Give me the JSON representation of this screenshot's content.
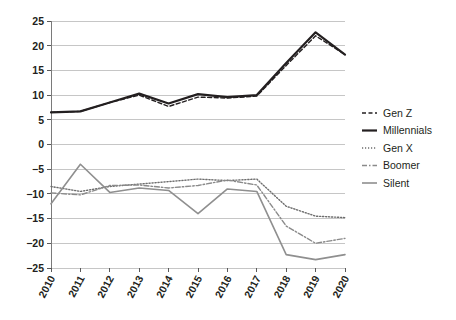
{
  "chart_data": {
    "type": "line",
    "title": "",
    "subtitle": "",
    "xlabel": "",
    "ylabel": "",
    "x": [
      2010,
      2011,
      2012,
      2013,
      2014,
      2015,
      2016,
      2017,
      2018,
      2019,
      2020
    ],
    "xtick_labels": [
      "2010",
      "2011",
      "2012",
      "2013",
      "2014",
      "2015",
      "2016",
      "2017",
      "2018",
      "2019",
      "2020"
    ],
    "ytick_labels": [
      "25",
      "20",
      "15",
      "10",
      "5",
      "0",
      "−5",
      "−10",
      "−15",
      "−20",
      "−25"
    ],
    "ytick_values": [
      25,
      20,
      15,
      10,
      5,
      0,
      -5,
      -10,
      -15,
      -20,
      -25
    ],
    "ylim": [
      -25,
      25
    ],
    "xlim": [
      2010,
      2020
    ],
    "grid": true,
    "grid_axis": "y",
    "legend_position": "right",
    "series": [
      {
        "name": "Gen Z",
        "style": "dashed",
        "color": "#231f20",
        "width": 1.4,
        "dasharray": "4,2.5",
        "values": [
          6.5,
          6.7,
          8.5,
          10.0,
          7.7,
          9.6,
          9.4,
          9.8,
          16.0,
          22.0,
          18.2
        ]
      },
      {
        "name": "Millennials",
        "style": "solid",
        "color": "#231f20",
        "width": 2.2,
        "dasharray": "none",
        "values": [
          6.5,
          6.7,
          8.5,
          10.3,
          8.3,
          10.2,
          9.6,
          10.0,
          16.5,
          22.7,
          18.2
        ]
      },
      {
        "name": "Gen X",
        "style": "dotted",
        "color": "#6d6d6d",
        "width": 1.4,
        "dasharray": "1.2,1.8",
        "values": [
          -8.5,
          -9.5,
          -8.5,
          -8.0,
          -7.5,
          -7.0,
          -7.3,
          -7.0,
          -12.5,
          -14.5,
          -14.8
        ]
      },
      {
        "name": "Boomer",
        "style": "dash-dot",
        "color": "#8a8a8a",
        "width": 1.4,
        "dasharray": "5,2,1.5,2",
        "values": [
          -9.8,
          -10.2,
          -8.3,
          -8.2,
          -8.8,
          -8.3,
          -7.2,
          -8.2,
          -16.5,
          -20.0,
          -19.0
        ]
      },
      {
        "name": "Silent",
        "style": "solid",
        "color": "#8f8f8f",
        "width": 1.6,
        "dasharray": "none",
        "values": [
          -12.0,
          -4.0,
          -9.7,
          -8.8,
          -9.3,
          -14.0,
          -9.0,
          -9.5,
          -22.3,
          -23.3,
          -22.3
        ]
      }
    ]
  },
  "legend": {
    "entries": [
      {
        "label": "Gen Z"
      },
      {
        "label": "Millennials"
      },
      {
        "label": "Gen X"
      },
      {
        "label": "Boomer"
      },
      {
        "label": "Silent"
      }
    ]
  }
}
